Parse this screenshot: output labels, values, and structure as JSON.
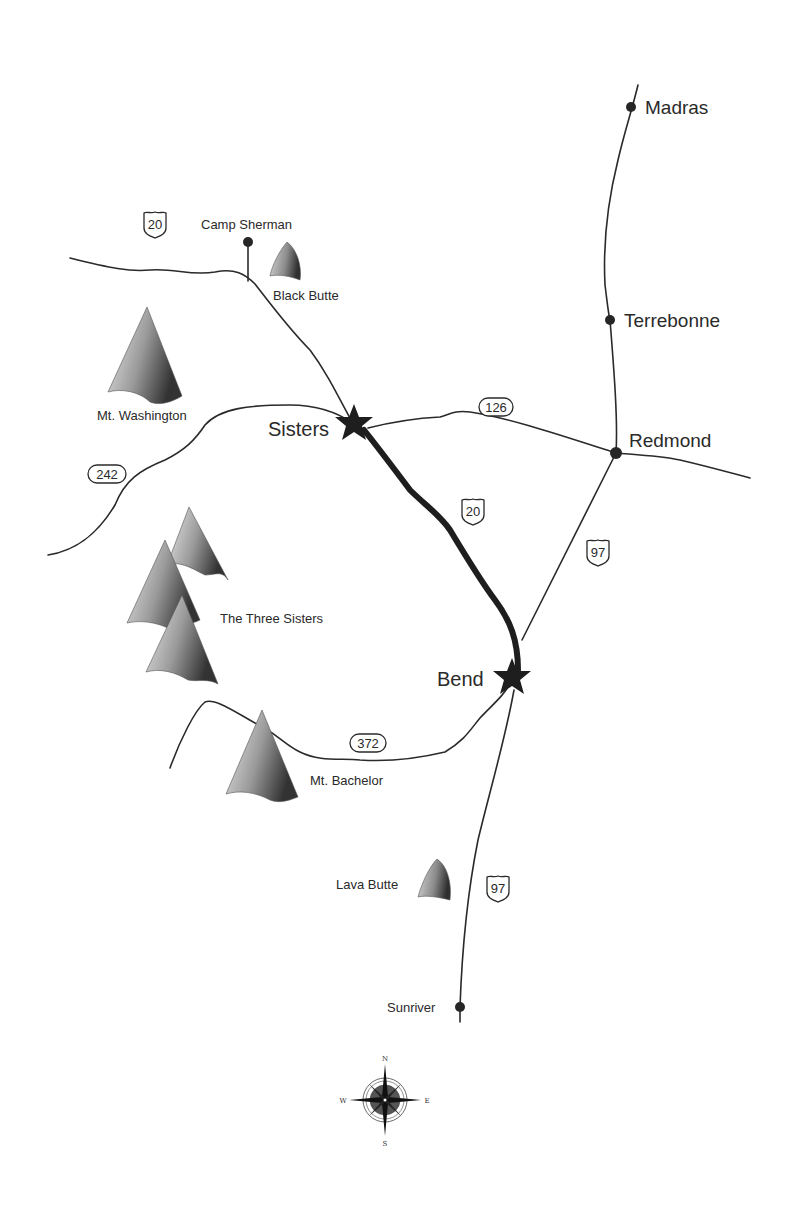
{
  "map": {
    "title": "Central Oregon Route Map",
    "colors": {
      "road": "#2a2a2a",
      "highlight_route": "#1e1e1e",
      "mountain_light": "#e6e6e6",
      "mountain_dark": "#3a3a3a",
      "background": "#ffffff"
    },
    "towns": [
      {
        "name": "Madras",
        "type": "dot",
        "x": 631,
        "y": 107
      },
      {
        "name": "Terrebonne",
        "type": "dot",
        "x": 610,
        "y": 320
      },
      {
        "name": "Redmond",
        "type": "dot",
        "x": 616,
        "y": 453
      },
      {
        "name": "Camp Sherman",
        "type": "dot",
        "x": 248,
        "y": 242
      },
      {
        "name": "Sisters",
        "type": "star",
        "x": 354,
        "y": 424
      },
      {
        "name": "Bend",
        "type": "star",
        "x": 512,
        "y": 678
      },
      {
        "name": "Sunriver",
        "type": "dot",
        "x": 460,
        "y": 1007
      }
    ],
    "mountains": [
      {
        "name": "Black Butte",
        "type": "butte"
      },
      {
        "name": "Mt. Washington",
        "type": "peak"
      },
      {
        "name": "The Three Sisters",
        "type": "peak-group"
      },
      {
        "name": "Mt. Bachelor",
        "type": "peak"
      },
      {
        "name": "Lava Butte",
        "type": "butte"
      }
    ],
    "route_markers": [
      {
        "route": "20",
        "type": "us-shield",
        "location": "west of Camp Sherman"
      },
      {
        "route": "20",
        "type": "us-shield",
        "location": "between Sisters and Bend"
      },
      {
        "route": "126",
        "type": "state-oval",
        "location": "between Sisters and Redmond"
      },
      {
        "route": "242",
        "type": "state-oval",
        "location": "west of Sisters"
      },
      {
        "route": "97",
        "type": "us-shield",
        "location": "between Redmond and Bend"
      },
      {
        "route": "372",
        "type": "state-oval",
        "location": "west of Bend"
      },
      {
        "route": "97",
        "type": "us-shield",
        "location": "south of Bend"
      }
    ],
    "highlighted_route": {
      "from": "Sisters",
      "to": "Bend",
      "via": "20"
    },
    "compass": {
      "north": "N",
      "south": "S",
      "east": "E",
      "west": "W"
    }
  }
}
